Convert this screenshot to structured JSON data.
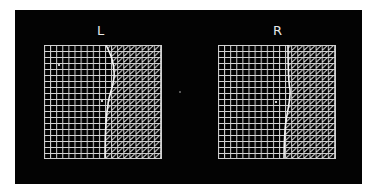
{
  "figure": {
    "background": "#030303",
    "line_color": "#d8d8d8",
    "panels": [
      {
        "id": "left",
        "label": "L",
        "grid_columns": 19,
        "grid_rows": 19,
        "boundary_curve_description": "wavy vertical boundary, bulges right in upper half",
        "left_region": "square grid",
        "right_region": "diagonal hatching"
      },
      {
        "id": "right",
        "label": "R",
        "grid_columns": 19,
        "grid_rows": 19,
        "boundary_curve_description": "nearly straight vertical boundary slanting slightly left at bottom",
        "left_region": "square grid",
        "right_region": "diagonal hatching"
      }
    ]
  }
}
